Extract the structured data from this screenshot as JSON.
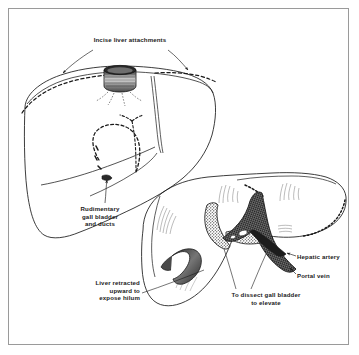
{
  "figure": {
    "type": "surgical-line-illustration",
    "background_color": "#ffffff",
    "ink_color": "#1a1a1a",
    "frame_color": "#9a9a9a",
    "panels": [
      {
        "name": "upper-liver-anterior-view",
        "description": "Anterior view of liver with inferior vena cava cuff at superior surface, dashed incision lines along superior attachments, falciform ligament, and dashed outline of rudimentary gall bladder and ducts"
      },
      {
        "name": "lower-liver-retracted-view",
        "description": "Liver retracted upward exposing the hilum, showing gall bladder, hepatic artery and portal vein"
      }
    ]
  },
  "labels": {
    "incise": "Incise liver attachments",
    "rudimentary": "Rudimentary\ngall bladder\nand ducts",
    "retracted": "Liver retracted\nupward to\nexpose hilum",
    "dissect": "To dissect gall bladder\nto elevate",
    "hepatic_artery": "Hepatic artery",
    "portal_vein": "Portal vein"
  }
}
